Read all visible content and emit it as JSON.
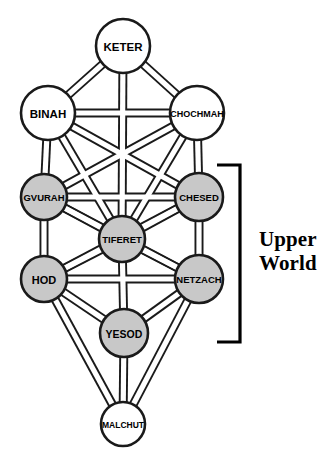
{
  "diagram": {
    "background_color": "#ffffff",
    "outline_color": "#1a1a1a",
    "shaded_fill_color": "#c8c8c8",
    "unshaded_fill_color": "#ffffff"
  },
  "nodes": [
    {
      "id": "keter",
      "label": "KETER",
      "cx": 123,
      "cy": 46,
      "r": 27,
      "fill": "white",
      "font_size": 11.5
    },
    {
      "id": "binah",
      "label": "BINAH",
      "cx": 48,
      "cy": 113,
      "r": 27,
      "fill": "white",
      "font_size": 11.5
    },
    {
      "id": "chochmah",
      "label": "CHOCHMAH",
      "cx": 197,
      "cy": 113,
      "r": 27,
      "fill": "white",
      "font_size": 9
    },
    {
      "id": "gvurah",
      "label": "GVURAH",
      "cx": 44,
      "cy": 197,
      "r": 23,
      "fill": "gray",
      "font_size": 9.5
    },
    {
      "id": "chesed",
      "label": "CHESED",
      "cx": 199,
      "cy": 197,
      "r": 24,
      "fill": "gray",
      "font_size": 9.5
    },
    {
      "id": "tiferet",
      "label": "TIFERET",
      "cx": 122,
      "cy": 239,
      "r": 23,
      "fill": "gray",
      "font_size": 9.5
    },
    {
      "id": "hod",
      "label": "HOD",
      "cx": 44,
      "cy": 279,
      "r": 23,
      "fill": "gray",
      "font_size": 11
    },
    {
      "id": "netzach",
      "label": "NETZACH",
      "cx": 199,
      "cy": 279,
      "r": 24,
      "fill": "gray",
      "font_size": 9.5
    },
    {
      "id": "yesod",
      "label": "YESOD",
      "cx": 124,
      "cy": 333,
      "r": 24,
      "fill": "gray",
      "font_size": 10.5
    },
    {
      "id": "malchut",
      "label": "MALCHUT",
      "cx": 123,
      "cy": 424,
      "r": 22,
      "fill": "white",
      "font_size": 8.5
    }
  ],
  "edges": [
    {
      "from": "keter",
      "to": "binah"
    },
    {
      "from": "keter",
      "to": "chochmah"
    },
    {
      "from": "keter",
      "to": "tiferet"
    },
    {
      "from": "binah",
      "to": "chochmah"
    },
    {
      "from": "binah",
      "to": "gvurah"
    },
    {
      "from": "binah",
      "to": "tiferet"
    },
    {
      "from": "binah",
      "to": "chesed"
    },
    {
      "from": "chochmah",
      "to": "chesed"
    },
    {
      "from": "chochmah",
      "to": "tiferet"
    },
    {
      "from": "chochmah",
      "to": "gvurah"
    },
    {
      "from": "gvurah",
      "to": "chesed"
    },
    {
      "from": "gvurah",
      "to": "tiferet"
    },
    {
      "from": "gvurah",
      "to": "hod"
    },
    {
      "from": "gvurah",
      "to": "netzach"
    },
    {
      "from": "chesed",
      "to": "tiferet"
    },
    {
      "from": "chesed",
      "to": "netzach"
    },
    {
      "from": "chesed",
      "to": "hod"
    },
    {
      "from": "tiferet",
      "to": "hod"
    },
    {
      "from": "tiferet",
      "to": "netzach"
    },
    {
      "from": "tiferet",
      "to": "yesod"
    },
    {
      "from": "hod",
      "to": "netzach"
    },
    {
      "from": "hod",
      "to": "yesod"
    },
    {
      "from": "hod",
      "to": "malchut"
    },
    {
      "from": "netzach",
      "to": "yesod"
    },
    {
      "from": "netzach",
      "to": "malchut"
    },
    {
      "from": "yesod",
      "to": "malchut"
    }
  ],
  "annotation": {
    "bracket": {
      "name": "upper-world-bracket",
      "x_spine": 240,
      "x_arm_end": 217,
      "y_top": 165,
      "y_bottom": 342
    },
    "label_text": "Upper\nWorld",
    "label_x": 259,
    "label_y": 228
  }
}
